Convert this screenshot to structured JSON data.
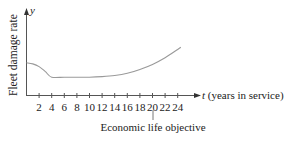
{
  "chart_data": {
    "type": "line",
    "title": "",
    "xlabel": "t (years in service)",
    "ylabel": "Fleet damage rate",
    "y_axis_symbol": "y",
    "x_axis_symbol": "t",
    "x_axis_suffix": "(years in service)",
    "xticks": [
      2,
      4,
      6,
      8,
      10,
      12,
      14,
      16,
      18,
      20,
      22,
      24
    ],
    "xlim": [
      0,
      26
    ],
    "yticks": [],
    "grid": false,
    "legend": null,
    "series": [
      {
        "name": "Fleet damage rate",
        "x": [
          0,
          1,
          2,
          3,
          4,
          6,
          8,
          10,
          12,
          14,
          16,
          18,
          20,
          22,
          24,
          24.5
        ],
        "y": [
          0.59,
          0.57,
          0.52,
          0.43,
          0.33,
          0.33,
          0.33,
          0.33,
          0.34,
          0.36,
          0.4,
          0.47,
          0.56,
          0.68,
          0.83,
          0.87
        ]
      }
    ],
    "annotations": [
      {
        "x": 20,
        "text": "Economic life objective"
      }
    ]
  },
  "labels": {
    "y_axis_title": "Fleet damage rate",
    "y_axis_symbol": "y",
    "x_axis_title": "t (years in service)",
    "annotation": "Economic life objective",
    "ticks": [
      "2",
      "4",
      "6",
      "8",
      "10",
      "12",
      "14",
      "16",
      "18",
      "20",
      "22",
      "24"
    ]
  }
}
